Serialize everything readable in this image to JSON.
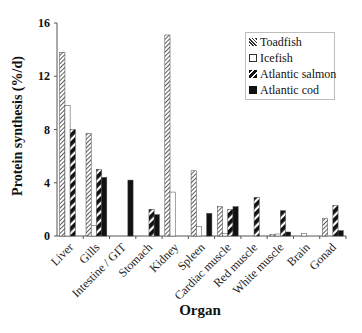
{
  "chart_data": {
    "type": "bar",
    "title": "",
    "xlabel": "Organ",
    "ylabel": "Protein synthesis (%/d)",
    "ylim": [
      0,
      16
    ],
    "yticks": [
      0,
      4,
      8,
      12,
      16
    ],
    "grid": false,
    "legend_position": "upper right",
    "categories": [
      "Liver",
      "Gills",
      "Intestine / GIT",
      "Stomach",
      "Kidney",
      "Spleen",
      "Cardiac muscle",
      "Red muscle",
      "White muscle",
      "Brain",
      "Gonad"
    ],
    "series": [
      {
        "name": "Toadfish",
        "pattern": "dense-diagonal-hatch",
        "values": [
          13.8,
          7.7,
          null,
          null,
          15.1,
          4.9,
          2.2,
          null,
          0.1,
          null,
          1.3
        ]
      },
      {
        "name": "Icefish",
        "pattern": "open-white",
        "values": [
          9.8,
          0.8,
          null,
          null,
          3.3,
          0.7,
          0.2,
          null,
          0.15,
          0.2,
          null
        ]
      },
      {
        "name": "Atlantic salmon",
        "pattern": "bold-diagonal-stripe",
        "values": [
          8.0,
          5.0,
          null,
          2.0,
          null,
          null,
          2.0,
          2.9,
          1.9,
          null,
          2.3
        ]
      },
      {
        "name": "Atlantic cod",
        "pattern": "solid-black",
        "values": [
          null,
          4.4,
          4.2,
          1.6,
          null,
          1.7,
          2.2,
          null,
          0.3,
          null,
          0.4
        ]
      }
    ]
  },
  "legend": {
    "items": [
      {
        "label": "Toadfish",
        "icon": "hatch-swatch"
      },
      {
        "label": "Icefish",
        "icon": "open-square"
      },
      {
        "label": "Atlantic salmon",
        "icon": "stripe-swatch"
      },
      {
        "label": "Atlantic cod",
        "icon": "solid-square"
      }
    ]
  },
  "colors": {
    "axis": "#555555",
    "bar_fill_dark": "#111111",
    "bar_fill_white": "#ffffff",
    "legend_border": "#bdbdbd"
  }
}
